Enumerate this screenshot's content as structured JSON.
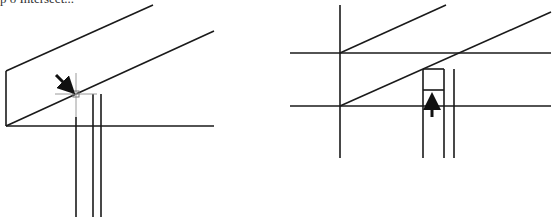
{
  "caption": "p o Intersect...",
  "colors": {
    "line": "#1a1a1a",
    "crosshair": "#9a9a9a",
    "arrow": "#111111"
  },
  "figures": [
    {
      "name": "left-figure",
      "description": "Beam drawn with snap crosshair at intersection, arrow pointing to snap point"
    },
    {
      "name": "right-figure",
      "description": "Beam with rectangle post below, arrow pointing up into rectangle"
    }
  ]
}
